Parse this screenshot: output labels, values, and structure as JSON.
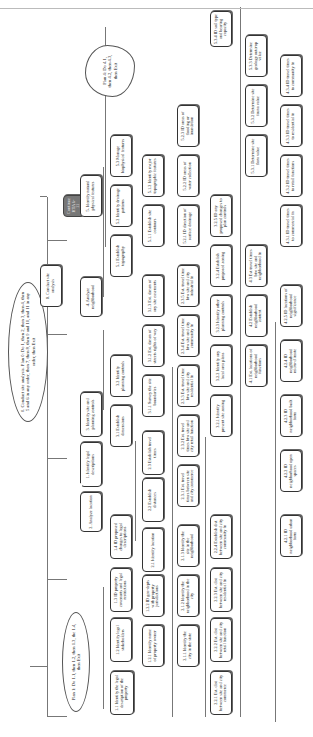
{
  "diagram": {
    "type": "hierarchical task analysis",
    "orientation": "rotated 90 degrees counter-clockwise",
    "root": "0. Conduct site analysis",
    "plans": {
      "plan0": "0. Conduct site analysis. Plan 0: Do 1, then 2, then 3, then 4, then 5 and 6 in any order, then 7, then 8, then 9 and 10, and 11 in any order, then Exit",
      "plan1": "Plan 1: Do 1.1, then 1.2, then 1.3, the 1.4, then Exit",
      "plan4": "Plan 4: Do 4.1, then 4.2, then 4.3, then Exit"
    },
    "nodes": {
      "n0": "0. Conduct site analysis",
      "n1": "1. Identify legal descriptions",
      "n1_1": "1.1 Identify the legal description of the property",
      "n1_2": "1.2 Identify legal stakeholders",
      "n1_2_1": "1.2.1 Identify name of property owner",
      "n1_2_2": "1.2.2 ID geo-depts with property jurisdictions",
      "n1_3": "1.3 ID property covenants and legal restrictions",
      "n1_4": "1.4 ID proposed changes to legal descriptions",
      "n2": "2. Analyze location",
      "n2_1": "2.1 Identify location",
      "n2_1_1": "2.1.1 Identify the city in the state",
      "n2_1_2": "2.1.2 Identify the neighborhood in the city",
      "n2_1_3": "2.1.3 Identify the site in the neighborhood",
      "n2_2": "2.2 Establish distances",
      "n2_2_1": "2.2.1 Est. dist between site and city commerce",
      "n2_2_2": "2.2.2 Est. dist between site and city retail function",
      "n2_2_3": "2.2.3 Est. dist between site and city residential fn",
      "n2_2_4": "2.2.4 Establish dist between site and city community fn",
      "n2_3": "2.3 Establish travel times",
      "n2_3_1": "2.3.1 Est. travel times between site and city commerce",
      "n2_3_2": "2.3.2 Est. travel times btw site and city retail function",
      "n2_3_3": "2.3.3 Est. travel time btw site and city residential fn",
      "n2_3_4": "2.3.4 Est. travel time btw site and city community fn",
      "n2_3_5": "2.3.5 Est. travel time btw site and city industrial fn",
      "n3": "3. Identify site and planning controls",
      "n3_1": "3.1 Establish dimensions",
      "n3_1_1": "3.1.1 Survey the site boundaries",
      "n3_1_2": "3.1.2 Est. dimen of streets rights of way",
      "n3_1_3": "3.1.3 Est. dimen of any site easements",
      "n3_2": "3.2 Identify planning controls",
      "n3_2_1": "3.2.1 Identify present site zoning",
      "n3_2_2": "3.2.2 Identify any local area plans",
      "n3_2_3": "3.2.3 Identify other planning controls",
      "n3_2_4": "3.2.4 Establish proposed zoning",
      "n3_2_5": "3.2.5 ID any proposed changes to plan controls",
      "n4": "4. Analyze neighborhood",
      "n4_1": "4.1 Est. locations of neighborhood functions",
      "n4_2": "4.2 Establish neighborhood context",
      "n4_2_1": "4.2.1 ID neighborhood urban form",
      "n4_2_2": "4.2.2 ID neighborhood open spaces",
      "n4_2_3": "4.2.3 ID neighborhood built form",
      "n4_2_4": "4.2.4 ID neighborhood micro-climate",
      "n4_2_5": "4.2.5 ID locations of neighborhood significance",
      "n4_3": "4.3 Est travel times btw site and neighborhood fn",
      "n4_3_1": "4.3.1 ID travel times to commercial fn",
      "n4_3_2": "4.3.2 ID travel times to retail functions",
      "n4_3_3": "4.3.3 ID travel times to residential fn",
      "n4_3_4": "4.3.4 ID travel times to community fn",
      "n5": "5. Identify natural physical features",
      "n5_1": "5.1 Establish topography",
      "n5_1_1": "5.1.1 Establish site contours",
      "n5_1_2": "5.1.2 Identify major topographic features",
      "n5_2": "5.2 Identify drainage patterns",
      "n5_2_1": "5.2.1 ID direction of surface drainage",
      "n5_2_2": "5.2.2 ID areas of water collection",
      "n5_2_3": "5.2.3 ID areas of flooding or inundation",
      "n5_3": "5.3 Manage biophysical features",
      "n5_3_1": "5.3.1 Determine site flora value",
      "n5_3_2": "5.3.2 Determine site fauna value",
      "n5_3_3": "5.3.3 Determine geology outcrop value",
      "n5_3_4": "5.3.4 ID soil type and bearing capacity",
      "cont": "Continue HTA 6-11"
    }
  }
}
